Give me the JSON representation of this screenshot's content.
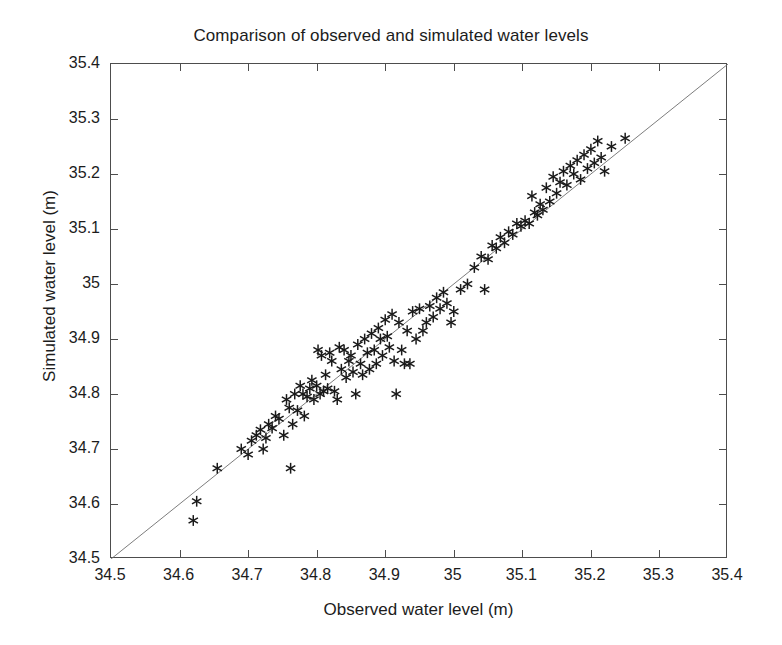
{
  "chart_data": {
    "type": "scatter",
    "title": "Comparison of observed and simulated water levels",
    "xlabel": "Observed water level (m)",
    "ylabel": "Simulated water level (m)",
    "xlim": [
      34.5,
      35.4
    ],
    "ylim": [
      34.5,
      35.4
    ],
    "xticks": [
      34.5,
      34.6,
      34.7,
      34.8,
      34.9,
      35,
      35.1,
      35.2,
      35.3,
      35.4
    ],
    "yticks": [
      34.5,
      34.6,
      34.7,
      34.8,
      34.9,
      35,
      35.1,
      35.2,
      35.3,
      35.4
    ],
    "xticklabels": [
      "34.5",
      "34.6",
      "34.7",
      "34.8",
      "34.9",
      "35",
      "35.1",
      "35.2",
      "35.3",
      "35.4"
    ],
    "yticklabels": [
      "34.5",
      "34.6",
      "34.7",
      "34.8",
      "34.9",
      "35",
      "35.1",
      "35.2",
      "35.3",
      "35.4"
    ],
    "grid": false,
    "legend": null,
    "marker": "asterisk",
    "marker_color": "#1a1a1a",
    "reference_line": {
      "label": "1:1 line",
      "x": [
        34.5,
        35.4
      ],
      "y": [
        34.5,
        35.4
      ],
      "color": "#6e6e6e"
    },
    "series": [
      {
        "name": "Observed vs simulated water level",
        "x": [
          34.62,
          34.625,
          34.655,
          34.69,
          34.7,
          34.705,
          34.712,
          34.718,
          34.722,
          34.726,
          34.73,
          34.735,
          34.74,
          34.745,
          34.752,
          34.756,
          34.76,
          34.762,
          34.765,
          34.768,
          34.772,
          34.776,
          34.78,
          34.782,
          34.786,
          34.79,
          34.793,
          34.796,
          34.8,
          34.802,
          34.805,
          34.807,
          34.81,
          34.813,
          34.816,
          34.819,
          34.822,
          34.826,
          34.83,
          34.833,
          34.836,
          34.84,
          34.843,
          34.847,
          34.85,
          34.853,
          34.857,
          34.86,
          34.864,
          34.867,
          34.87,
          34.874,
          34.877,
          34.88,
          34.884,
          34.887,
          34.89,
          34.893,
          34.896,
          34.9,
          34.903,
          34.906,
          34.91,
          34.913,
          34.916,
          34.92,
          34.924,
          34.928,
          34.932,
          34.936,
          34.94,
          34.945,
          34.95,
          34.955,
          34.96,
          34.965,
          34.97,
          34.975,
          34.98,
          34.985,
          34.99,
          34.996,
          35.0,
          35.01,
          35.02,
          35.03,
          35.04,
          35.045,
          35.05,
          35.056,
          35.062,
          35.068,
          35.074,
          35.08,
          35.086,
          35.092,
          35.098,
          35.104,
          35.11,
          35.114,
          35.118,
          35.122,
          35.126,
          35.13,
          35.135,
          35.14,
          35.145,
          35.15,
          35.155,
          35.16,
          35.165,
          35.17,
          35.175,
          35.18,
          35.185,
          35.19,
          35.195,
          35.2,
          35.205,
          35.21,
          35.215,
          35.22,
          35.23,
          35.25
        ],
        "y": [
          34.57,
          34.605,
          34.665,
          34.7,
          34.69,
          34.715,
          34.725,
          34.735,
          34.7,
          34.72,
          34.745,
          34.738,
          34.76,
          34.755,
          34.725,
          34.79,
          34.775,
          34.665,
          34.745,
          34.8,
          34.77,
          34.815,
          34.8,
          34.76,
          34.795,
          34.81,
          34.825,
          34.79,
          34.815,
          34.88,
          34.8,
          34.87,
          34.805,
          34.835,
          34.81,
          34.875,
          34.86,
          34.805,
          34.79,
          34.885,
          34.845,
          34.88,
          34.83,
          34.86,
          34.87,
          34.84,
          34.8,
          34.89,
          34.855,
          34.835,
          34.9,
          34.875,
          34.845,
          34.91,
          34.88,
          34.855,
          34.92,
          34.9,
          34.87,
          34.935,
          34.905,
          34.885,
          34.945,
          34.86,
          34.8,
          34.93,
          34.88,
          34.855,
          34.915,
          34.855,
          34.95,
          34.9,
          34.955,
          34.915,
          34.93,
          34.96,
          34.94,
          34.975,
          34.955,
          34.985,
          34.965,
          34.93,
          34.95,
          34.99,
          35.0,
          35.03,
          35.05,
          34.99,
          35.045,
          35.07,
          35.065,
          35.085,
          35.075,
          35.095,
          35.09,
          35.11,
          35.105,
          35.115,
          35.11,
          35.16,
          35.13,
          35.125,
          35.145,
          35.135,
          35.175,
          35.15,
          35.195,
          35.165,
          35.185,
          35.205,
          35.18,
          35.215,
          35.2,
          35.225,
          35.19,
          35.235,
          35.21,
          35.245,
          35.22,
          35.26,
          35.23,
          35.205,
          35.25,
          35.265
        ]
      }
    ]
  }
}
